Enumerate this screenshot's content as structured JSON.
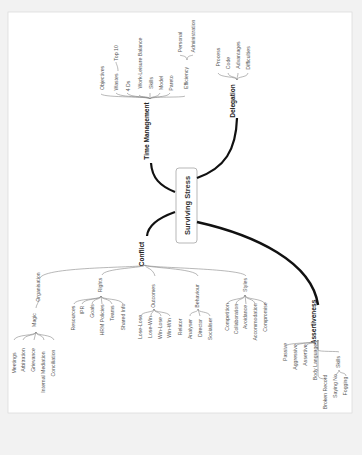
{
  "page": {
    "background": "#f2f2f2",
    "paper": "#ffffff",
    "border": "#dddddd"
  },
  "center": {
    "label": "Surviving Stress"
  },
  "branches": {
    "time_management": {
      "label": "Time Management",
      "children": [
        "Objectives",
        "Wastes",
        "Top 10",
        "4 Ds",
        "Work-Leisure Balance",
        "Skills",
        "Model",
        "Pareto",
        "Efficiency",
        "Personal",
        "Administration"
      ]
    },
    "delegation": {
      "label": "Delegation",
      "children": [
        "Process",
        "Code",
        "Advantages",
        "Difficulties"
      ]
    },
    "conflict": {
      "label": "Conflict",
      "organisation": {
        "label": "Organisation",
        "magic": "Magic",
        "children": [
          "Meetings",
          "Arbitration",
          "Grievance",
          "Internal Mediation",
          "Conciliation"
        ]
      },
      "rights": {
        "label": "Rights",
        "children": [
          "Resources",
          "IPR",
          "Goals",
          "HRM Policies",
          "Teams",
          "Shared Info"
        ]
      },
      "outcomes": {
        "label": "Outcomes",
        "children": [
          "Lose-Lose",
          "Lose-Win",
          "Win-Lose",
          "Win-Win"
        ]
      },
      "behaviour": {
        "label": "Behaviour",
        "children": [
          "Relator",
          "Analyser",
          "Director",
          "Socialiser"
        ]
      },
      "styles": {
        "label": "Styles",
        "children": [
          "Competition",
          "Collaboration",
          "Avoidance",
          "Accommodation",
          "Compromise"
        ]
      }
    },
    "assertiveness": {
      "label": "Assertiveness",
      "children": [
        "Passive",
        "Aggressive",
        "Assertive",
        "Body Language",
        "Broken Record"
      ],
      "skills": {
        "label": "Skills",
        "children": [
          "Saying No",
          "Fogging"
        ]
      }
    }
  }
}
